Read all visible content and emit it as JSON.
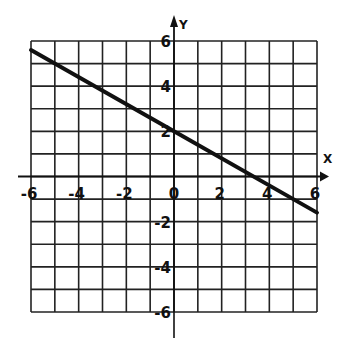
{
  "chart_data": {
    "type": "line",
    "title": "",
    "xlabel": "X",
    "ylabel": "Y",
    "xlim": [
      -6,
      6
    ],
    "ylim": [
      -6,
      6
    ],
    "grid": true,
    "grid_step": 1,
    "x_tick_labels": [
      "-6",
      "-4",
      "-2",
      "0",
      "2",
      "4",
      "6"
    ],
    "y_tick_labels": [
      "6",
      "4",
      "2",
      "-2",
      "-4",
      "-6"
    ],
    "series": [
      {
        "name": "line",
        "equation": "y = -0.6x + 2",
        "x": [
          -6,
          0,
          6
        ],
        "y": [
          5.6,
          2,
          -1.6
        ]
      }
    ],
    "colors": {
      "line": "#111111",
      "grid": "#222222",
      "background": "#ffffff"
    }
  }
}
